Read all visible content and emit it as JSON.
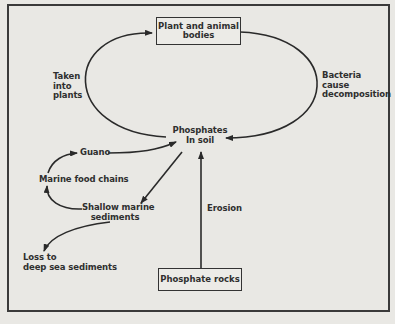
{
  "diagram": {
    "nodes": {
      "plant_animal": {
        "line1": "Plant and animal",
        "line2": "bodies"
      },
      "phosphates_soil": {
        "line1": "Phosphates",
        "line2": "In soil"
      },
      "phosphate_rocks": {
        "label": "Phosphate rocks"
      },
      "guano": {
        "label": "Guano"
      },
      "marine_food": {
        "label": "Marine food chains"
      },
      "shallow": {
        "line1": "Shallow marine",
        "line2": "sediments"
      },
      "loss": {
        "line1": "Loss to",
        "line2": "deep sea sediments"
      }
    },
    "edge_labels": {
      "taken": {
        "line1": "Taken",
        "line2": "into",
        "line3": "plants"
      },
      "bacteria": {
        "line1": "Bacteria",
        "line2": "cause",
        "line3": "decomposition"
      },
      "erosion": {
        "label": "Erosion"
      }
    },
    "edges": [
      {
        "from": "Phosphates In soil",
        "to": "Plant and animal bodies",
        "label": "Taken into plants"
      },
      {
        "from": "Plant and animal bodies",
        "to": "Phosphates In soil",
        "label": "Bacteria cause decomposition"
      },
      {
        "from": "Phosphate rocks",
        "to": "Phosphates In soil",
        "label": "Erosion"
      },
      {
        "from": "Phosphates In soil",
        "to": "Shallow marine sediments",
        "label": ""
      },
      {
        "from": "Shallow marine sediments",
        "to": "Marine food chains",
        "label": ""
      },
      {
        "from": "Marine food chains",
        "to": "Guano",
        "label": ""
      },
      {
        "from": "Guano",
        "to": "Phosphates In soil",
        "label": ""
      },
      {
        "from": "Shallow marine sediments",
        "to": "Loss to deep sea sediments",
        "label": ""
      }
    ],
    "colors": {
      "background": "#e9e8e4",
      "ink": "#2f2f2f"
    }
  }
}
